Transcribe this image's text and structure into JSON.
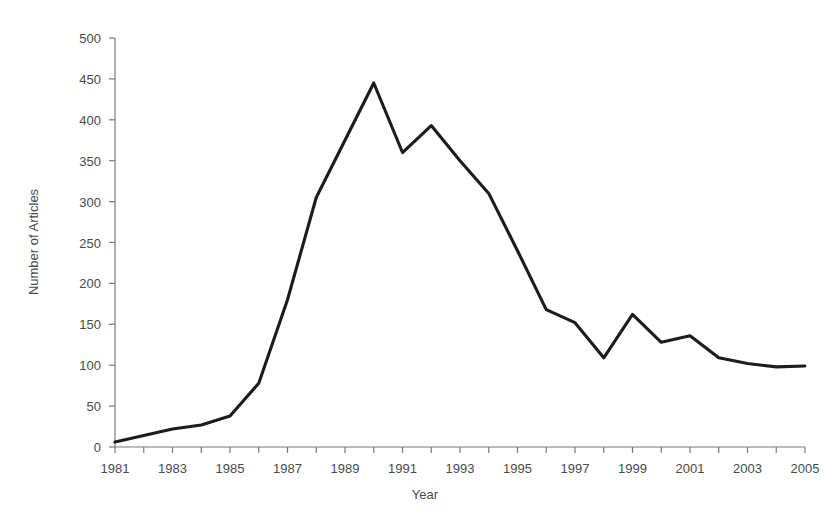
{
  "chart_data": {
    "type": "line",
    "title": "",
    "xlabel": "Year",
    "ylabel": "Number of Articles",
    "x": [
      1981,
      1982,
      1983,
      1984,
      1985,
      1986,
      1987,
      1988,
      1989,
      1990,
      1991,
      1992,
      1993,
      1994,
      1995,
      1996,
      1997,
      1998,
      1999,
      2000,
      2001,
      2002,
      2003,
      2004,
      2005
    ],
    "values": [
      6,
      14,
      22,
      27,
      38,
      78,
      180,
      305,
      375,
      445,
      360,
      393,
      350,
      310,
      240,
      168,
      152,
      109,
      162,
      128,
      136,
      109,
      102,
      98,
      99
    ],
    "series": [
      {
        "name": "Number of Articles",
        "values": [
          6,
          14,
          22,
          27,
          38,
          78,
          180,
          305,
          375,
          445,
          360,
          393,
          350,
          310,
          240,
          168,
          152,
          109,
          162,
          128,
          136,
          109,
          102,
          98,
          99
        ]
      }
    ],
    "xlim": [
      1981,
      2005
    ],
    "ylim": [
      0,
      500
    ],
    "y_ticks": [
      0,
      50,
      100,
      150,
      200,
      250,
      300,
      350,
      400,
      450,
      500
    ],
    "y_tick_labels": [
      "0",
      "50",
      "100",
      "150",
      "200",
      "250",
      "300",
      "350",
      "400",
      "450",
      "500"
    ],
    "x_ticks": [
      1981,
      1982,
      1983,
      1984,
      1985,
      1986,
      1987,
      1988,
      1989,
      1990,
      1991,
      1992,
      1993,
      1994,
      1995,
      1996,
      1997,
      1998,
      1999,
      2000,
      2001,
      2002,
      2003,
      2004,
      2005
    ],
    "x_tick_labels": [
      "1981",
      "",
      "1983",
      "",
      "1985",
      "",
      "1987",
      "",
      "1989",
      "",
      "1991",
      "",
      "1993",
      "",
      "1995",
      "",
      "1997",
      "",
      "1999",
      "",
      "2001",
      "",
      "2003",
      "",
      "2005"
    ],
    "x_labels_visible": [
      "1981",
      "1983",
      "1985",
      "1987",
      "1989",
      "1991",
      "1993",
      "1995",
      "1997",
      "1999",
      "2001",
      "2003",
      "2005"
    ],
    "grid": false,
    "legend": false,
    "legend_position": "none",
    "line_color": "#1c1c1c",
    "axis_color": "#7a7a7a",
    "background_color": "#ffffff",
    "annotations": []
  },
  "axis": {
    "y_title": "Number of Articles",
    "x_title": "Year"
  }
}
